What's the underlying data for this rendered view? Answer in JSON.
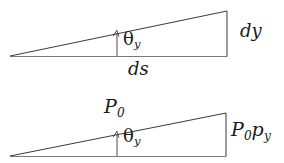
{
  "figure": {
    "background_color": "#ffffff",
    "stroke_color": "#3a3a3a",
    "text_color": "#1a1a1a"
  },
  "diagrams": [
    {
      "id": "triangle-top",
      "name": "slope-triangle-dy-ds",
      "labels": {
        "vertical_side": "dy",
        "base_side": "ds",
        "angle": "θ",
        "angle_subscript": "y"
      },
      "geometry": {
        "apex_left": [
          10,
          56
        ],
        "corner_top_right": [
          227,
          11
        ],
        "corner_bottom_right": [
          227,
          56
        ],
        "angle_arrow_x": 117,
        "angle_arrow_top_y": 31,
        "angle_arrow_bottom_y": 56
      }
    },
    {
      "id": "triangle-bottom",
      "name": "slope-triangle-p0-p0py",
      "labels": {
        "hypotenuse": "P",
        "hypotenuse_subscript": "0",
        "vertical_side": "P",
        "vertical_side_subscript_1": "0",
        "vertical_side_second": "p",
        "vertical_side_subscript_2": "y",
        "angle": "θ",
        "angle_subscript": "y"
      },
      "geometry": {
        "apex_left": [
          10,
          156
        ],
        "corner_top_right": [
          226,
          113
        ],
        "corner_bottom_right": [
          226,
          156
        ],
        "angle_arrow_x": 117,
        "angle_arrow_top_y": 132,
        "angle_arrow_bottom_y": 156
      }
    }
  ]
}
